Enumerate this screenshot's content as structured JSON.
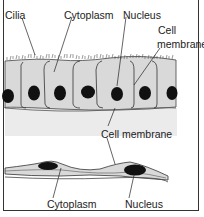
{
  "diagram": {
    "title": "",
    "colors": {
      "cytoplasm": "#d9d9d9",
      "lower_band": "#ebebeb",
      "nucleus": "#111111",
      "membrane": "#333333",
      "frame": "#333333"
    },
    "upper_section": {
      "description": "Ciliated columnar epithelial cells",
      "labels": {
        "cilia": "Cilia",
        "cytoplasm": "Cytoplasm",
        "nucleus": "Nucleus",
        "cell_membrane_line1": "Cell",
        "cell_membrane_line2": "membrane"
      },
      "cell_count": 7
    },
    "middle_label": {
      "cell_membrane": "Cell membrane"
    },
    "lower_section": {
      "description": "Flattened squamous cells",
      "labels": {
        "cytoplasm": "Cytoplasm",
        "nucleus": "Nucleus"
      },
      "nucleus_count": 2
    }
  }
}
